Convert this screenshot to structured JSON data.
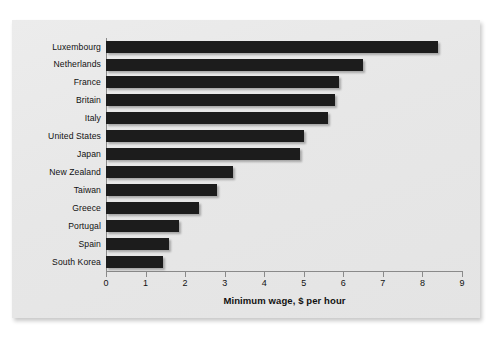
{
  "chart_data": {
    "type": "bar",
    "orientation": "horizontal",
    "title": "",
    "xlabel": "Minimum wage, $ per hour",
    "ylabel": "",
    "xlim": [
      0,
      9
    ],
    "xticks": [
      0,
      1,
      2,
      3,
      4,
      5,
      6,
      7,
      8,
      9
    ],
    "xtick_labels": [
      "0",
      "1",
      "2",
      "3",
      "4",
      "5",
      "6",
      "7",
      "8",
      "9"
    ],
    "grid": false,
    "legend": null,
    "bar_color": "#1c1c1c",
    "panel_color": "#e9e9e9",
    "categories": [
      "Luxembourg",
      "Netherlands",
      "France",
      "Britain",
      "Italy",
      "United States",
      "Japan",
      "New Zealand",
      "Taiwan",
      "Greece",
      "Portugal",
      "Spain",
      "South Korea"
    ],
    "values": [
      8.4,
      6.5,
      5.9,
      5.8,
      5.6,
      5.0,
      4.9,
      3.2,
      2.8,
      2.35,
      1.85,
      1.6,
      1.45
    ]
  }
}
